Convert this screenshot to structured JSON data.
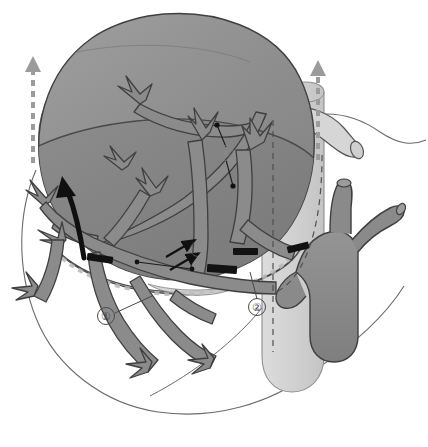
{
  "figure": {
    "background_color": "#ffffff"
  },
  "palette": {
    "organ_dome_upper": "#8f8f8f",
    "organ_dome_lower": "#7d7d7d",
    "organ_dome_highlight": "#9a9a9a",
    "vessel_fill": "#8a8a8a",
    "vessel_dark_fill": "#6f6f6f",
    "cava_fill": "#d2d2d2",
    "outline": "#3f3f3f",
    "faint_outline": "#6b6b6b",
    "clip_black": "#121212",
    "arrow_black": "#101010",
    "arrow_dashed_gray": "#9b9b9b",
    "label_text": "#3d3d3d",
    "label_faint_text": "#8d8d8d"
  },
  "callouts": [
    {
      "id": "callout-1",
      "label": "①",
      "x": 106,
      "y": 316,
      "faint": false,
      "leader_to": {
        "x": 148,
        "y": 297
      }
    },
    {
      "id": "callout-2",
      "label": "②",
      "x": 257,
      "y": 307,
      "faint": false,
      "leader_to": {
        "x": 249,
        "y": 272
      }
    },
    {
      "id": "callout-3",
      "label": "③",
      "x": 198,
      "y": 249,
      "faint": true,
      "leader_to": {
        "x": 196,
        "y": 262
      }
    },
    {
      "id": "callout-4",
      "label": "④",
      "x": 226,
      "y": 153,
      "faint": true,
      "leader_to": {
        "x": 233,
        "y": 186
      }
    }
  ],
  "annotations": {
    "dot_markers": [
      {
        "id": "dot-upper",
        "x": 217,
        "y": 125
      },
      {
        "id": "dot-lower",
        "x": 233,
        "y": 186
      },
      {
        "id": "dot-clip-left",
        "x": 137,
        "y": 262
      },
      {
        "id": "dot-clip-mid",
        "x": 192,
        "y": 269
      }
    ],
    "ligation_clips": [
      {
        "id": "clip-left",
        "cx": 100,
        "cy": 259,
        "w": 26,
        "h": 7,
        "rot": 8
      },
      {
        "id": "clip-center",
        "cx": 222,
        "cy": 269,
        "w": 30,
        "h": 8,
        "rot": 4
      },
      {
        "id": "clip-right-inner",
        "cx": 245,
        "cy": 251,
        "w": 25,
        "h": 7,
        "rot": 0
      },
      {
        "id": "clip-right-outer",
        "cx": 298,
        "cy": 247,
        "w": 22,
        "h": 7,
        "rot": -14
      }
    ],
    "arrows": {
      "solid_black_large": {
        "id": "retraction-arrow",
        "tip": {
          "x": 62,
          "y": 178
        },
        "tail": {
          "x": 82,
          "y": 256
        }
      },
      "small_black": [
        {
          "id": "small-arrow-upper",
          "from": {
            "x": 168,
            "y": 256
          },
          "to": {
            "x": 196,
            "y": 240
          }
        },
        {
          "id": "small-arrow-lower",
          "from": {
            "x": 172,
            "y": 268
          },
          "to": {
            "x": 200,
            "y": 252
          }
        }
      ],
      "dashed_gray": [
        {
          "id": "dashed-arrow-left",
          "x": 33,
          "y_top": 59,
          "y_bottom": 163
        },
        {
          "id": "dashed-arrow-right",
          "x": 318,
          "y_top": 62,
          "y_bottom": 160
        }
      ]
    },
    "dashed_guides": [
      {
        "id": "guide-resection-vertical-right",
        "x": 273,
        "y_top": 120,
        "y_bottom": 350
      },
      {
        "id": "guide-cava-right",
        "x": 322,
        "y_top": 155,
        "y_bottom": 290
      }
    ]
  },
  "structures": [
    {
      "id": "liver-dome",
      "name": "liver-dome",
      "label": "liver parenchyma dome"
    },
    {
      "id": "liver-dome-ridge",
      "name": "liver-dome-ridge",
      "label": "dome ridge crease"
    },
    {
      "id": "cut-surface",
      "name": "cut-surface",
      "label": "transection plane"
    },
    {
      "id": "vena-cava",
      "name": "vena-cava",
      "label": "inferior vena cava"
    },
    {
      "id": "hepatic-vein-stump",
      "name": "hepatic-vein-stump",
      "label": "hepatic vein stump"
    },
    {
      "id": "portal-trunk",
      "name": "portal-trunk",
      "label": "portal vein trunk"
    },
    {
      "id": "portal-branch-a",
      "name": "portal-branch-upper",
      "label": "portal branch (superior stump)"
    },
    {
      "id": "portal-branch-b",
      "name": "portal-branch-lateral",
      "label": "portal branch (lateral stump)"
    },
    {
      "id": "biliary-tree",
      "name": "biliary-tree",
      "label": "intrahepatic branching tree"
    },
    {
      "id": "organ-silhouette",
      "name": "organ-silhouette",
      "label": "remnant organ silhouette outline"
    }
  ]
}
